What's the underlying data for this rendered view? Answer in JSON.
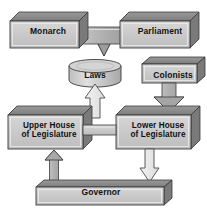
{
  "diagram": {
    "background_color": "#ffffff",
    "box_face_color": "#c9c9c9",
    "box_top_color": "#8a8a8a",
    "box_side_color": "#6e6e6e",
    "arrow_solid_color": "#b4b4b4",
    "arrow_hollow_color": "#e8e8e8",
    "outline_color": "#2b2b2b",
    "text_color": "#111111",
    "nodes": [
      {
        "id": "monarch",
        "label": "Monarch",
        "shape": "box-3d"
      },
      {
        "id": "parliament",
        "label": "Parliament",
        "shape": "box-3d"
      },
      {
        "id": "laws",
        "label": "Laws",
        "shape": "cylinder"
      },
      {
        "id": "colonists",
        "label": "Colonists",
        "shape": "box-3d"
      },
      {
        "id": "upper_house",
        "label_line1": "Upper House",
        "label_line2": "of Legislature",
        "shape": "box-3d"
      },
      {
        "id": "lower_house",
        "label_line1": "Lower House",
        "label_line2": "of Legislature",
        "shape": "box-3d"
      },
      {
        "id": "governor",
        "label": "Governor",
        "shape": "box-3d-flat"
      }
    ],
    "connections": [
      {
        "from": "monarch",
        "to": "laws",
        "style": "solid-gray",
        "direction": "down"
      },
      {
        "from": "parliament",
        "to": "laws",
        "style": "solid-gray",
        "direction": "down"
      },
      {
        "from": "colonists",
        "to": "lower_house",
        "style": "solid-gray",
        "direction": "down"
      },
      {
        "from": "upper_house",
        "to": "laws",
        "style": "hollow-white",
        "direction": "up"
      },
      {
        "from": "lower_house",
        "to": "laws",
        "style": "hollow-white",
        "direction": "up"
      },
      {
        "from": "upper_house",
        "to": "lower_house",
        "style": "bar",
        "direction": "horizontal"
      },
      {
        "from": "governor",
        "to": "upper_house",
        "style": "solid-gray",
        "direction": "up"
      },
      {
        "from": "lower_house",
        "to": "governor",
        "style": "hollow-white",
        "direction": "down"
      }
    ]
  }
}
